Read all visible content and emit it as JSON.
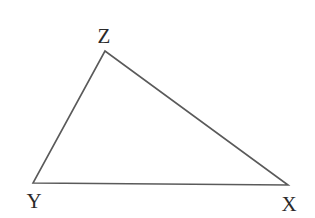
{
  "diagram": {
    "type": "triangle",
    "stroke_color": "#5a5a5a",
    "label_color": "#2a2a2a",
    "vertices": [
      {
        "name": "Z",
        "x": 105,
        "y": 51,
        "label_x": 104,
        "label_y": 43
      },
      {
        "name": "Y",
        "x": 33,
        "y": 183,
        "label_x": 34,
        "label_y": 208
      },
      {
        "name": "X",
        "x": 288,
        "y": 185,
        "label_x": 289,
        "label_y": 211
      }
    ],
    "labels": {
      "z": "Z",
      "y": "Y",
      "x": "X"
    },
    "edges": [
      {
        "from": "Z",
        "to": "Y",
        "name": "side-ZY"
      },
      {
        "from": "Y",
        "to": "X",
        "name": "side-YX"
      },
      {
        "from": "X",
        "to": "Z",
        "name": "side-XZ"
      }
    ]
  }
}
